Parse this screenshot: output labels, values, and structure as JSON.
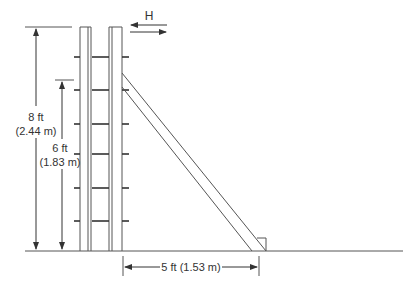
{
  "diagram": {
    "type": "ladder-cage-dimension-drawing",
    "colors": {
      "line": "#555555",
      "rung": "#333333",
      "text": "#333333",
      "background": "#ffffff"
    },
    "labels": {
      "force": "H",
      "height_8_ft": "8 ft",
      "height_8_m": "(2.44 m)",
      "height_6_ft": "6 ft",
      "height_6_m": "(1.83 m)",
      "base_distance": "5 ft (1.53 m)"
    },
    "dimensions": [
      {
        "name": "overall-height",
        "imperial": "8 ft",
        "metric": "2.44 m"
      },
      {
        "name": "brace-attachment-height",
        "imperial": "6 ft",
        "metric": "1.83 m"
      },
      {
        "name": "brace-base-distance",
        "imperial": "5 ft",
        "metric": "1.53 m"
      }
    ],
    "rung_count": 6
  }
}
